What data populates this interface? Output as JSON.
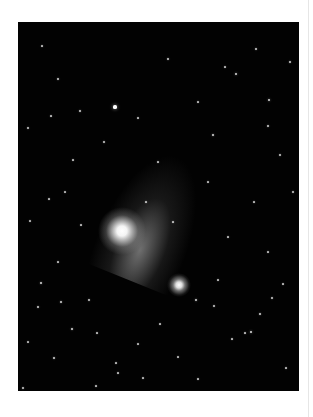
{
  "image": {
    "subject": "comet with tail near a globular star cluster against a star field",
    "frame": {
      "x": 18,
      "y": 22,
      "width": 281,
      "height": 369
    },
    "background_color": "#020202",
    "comet_nucleus": {
      "x": 103,
      "y": 209
    },
    "cluster_center": {
      "x": 160,
      "y": 262
    },
    "stars": [
      [
        97,
        85,
        3.2
      ],
      [
        251,
        78,
        2
      ],
      [
        218,
        52,
        2
      ],
      [
        150,
        37,
        1.4
      ],
      [
        238,
        27,
        1.4
      ],
      [
        272,
        40,
        1.5
      ],
      [
        40,
        57,
        1.4
      ],
      [
        62,
        89,
        1.4
      ],
      [
        195,
        113,
        1.6
      ],
      [
        250,
        104,
        1.4
      ],
      [
        10,
        106,
        1.3
      ],
      [
        33,
        94,
        1.2
      ],
      [
        120,
        96,
        1.2
      ],
      [
        180,
        80,
        1.2
      ],
      [
        207,
        45,
        1.2
      ],
      [
        24,
        24,
        1.2
      ],
      [
        86,
        120,
        1.3
      ],
      [
        55,
        138,
        1.2
      ],
      [
        140,
        140,
        1.2
      ],
      [
        262,
        133,
        1.3
      ],
      [
        31,
        177,
        1.2
      ],
      [
        47,
        170,
        1.1
      ],
      [
        128,
        180,
        1.2
      ],
      [
        190,
        160,
        1.2
      ],
      [
        236,
        180,
        1.2
      ],
      [
        275,
        170,
        1.3
      ],
      [
        12,
        199,
        1.1
      ],
      [
        63,
        203,
        1.2
      ],
      [
        155,
        200,
        1.2
      ],
      [
        210,
        215,
        1.2
      ],
      [
        250,
        230,
        1.2
      ],
      [
        40,
        240,
        1.2
      ],
      [
        20,
        285,
        1.4
      ],
      [
        43,
        280,
        1.5
      ],
      [
        54,
        307,
        1.6
      ],
      [
        71,
        278,
        1.3
      ],
      [
        79,
        311,
        1.2
      ],
      [
        98,
        341,
        1.2
      ],
      [
        23,
        261,
        1.6
      ],
      [
        36,
        336,
        1.5
      ],
      [
        78,
        364,
        1.2
      ],
      [
        100,
        351,
        1.2
      ],
      [
        125,
        356,
        1.2
      ],
      [
        233,
        310,
        2.1
      ],
      [
        242,
        292,
        1.5
      ],
      [
        178,
        278,
        1.8
      ],
      [
        196,
        284,
        1.3
      ],
      [
        227,
        311,
        1.2
      ],
      [
        214,
        317,
        1.2
      ],
      [
        142,
        302,
        1.2
      ],
      [
        254,
        276,
        1.3
      ],
      [
        268,
        346,
        1.2
      ],
      [
        180,
        357,
        1.2
      ],
      [
        120,
        322,
        1.1
      ],
      [
        160,
        335,
        1.1
      ],
      [
        5,
        366,
        1.3
      ],
      [
        200,
        258,
        1.2
      ],
      [
        265,
        262,
        1.2
      ],
      [
        10,
        320,
        1.1
      ],
      [
        145,
        376,
        1.1
      ]
    ]
  }
}
